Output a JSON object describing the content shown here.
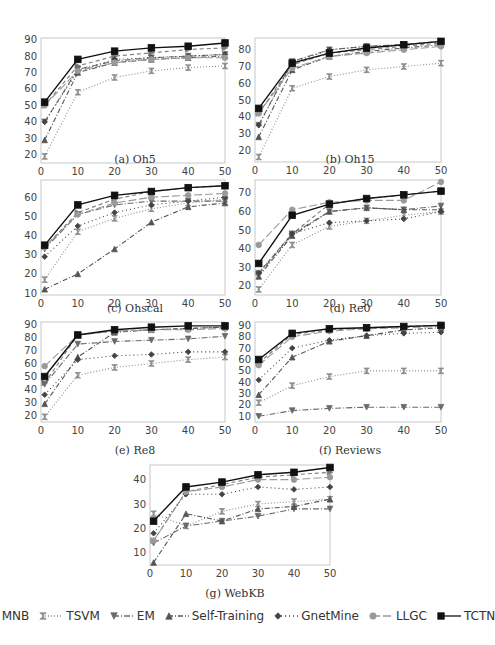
{
  "legend": [
    {
      "name": "MNB",
      "marker": "triangle-right",
      "dash": "4,3",
      "color": "#7a7a7a"
    },
    {
      "name": "TSVM",
      "marker": "hourglass",
      "dash": "1,2",
      "color": "#8c8c8c"
    },
    {
      "name": "EM",
      "marker": "triangle-down",
      "dash": "6,2,1,2",
      "color": "#6a6a6a"
    },
    {
      "name": "Self-Training",
      "marker": "triangle-up",
      "dash": "5,2,1,2",
      "color": "#555555"
    },
    {
      "name": "GnetMine",
      "marker": "diamond",
      "dash": "1,3",
      "color": "#444444"
    },
    {
      "name": "LLGC",
      "marker": "circle",
      "dash": "8,3",
      "color": "#9a9a9a"
    },
    {
      "name": "TCTN",
      "marker": "square",
      "dash": "",
      "color": "#111111"
    }
  ],
  "chart_data": [
    {
      "id": "a",
      "type": "line",
      "title": "(a) Oh5",
      "x": [
        1,
        10,
        20,
        30,
        40,
        50
      ],
      "xticks": [
        0,
        10,
        20,
        30,
        40,
        50
      ],
      "yticks": [
        20,
        30,
        40,
        50,
        60,
        70,
        80,
        90
      ],
      "ylim": [
        15,
        91
      ],
      "xlim": [
        0,
        50
      ],
      "xlabel": "",
      "ylabel": "",
      "series": [
        {
          "name": "MNB",
          "values": [
            50,
            74,
            80,
            82,
            84,
            85
          ]
        },
        {
          "name": "TSVM",
          "values": [
            19,
            58,
            67,
            71,
            73,
            74
          ]
        },
        {
          "name": "EM",
          "values": [
            40,
            72,
            77,
            79,
            80,
            81
          ]
        },
        {
          "name": "Self-Training",
          "values": [
            29,
            70,
            76,
            78,
            79,
            80
          ]
        },
        {
          "name": "GnetMine",
          "values": [
            40,
            71,
            78,
            79,
            80,
            81
          ]
        },
        {
          "name": "LLGC",
          "values": [
            50,
            71,
            76,
            78,
            79,
            79
          ]
        },
        {
          "name": "TCTN",
          "values": [
            52,
            78,
            83,
            85,
            86,
            88
          ]
        }
      ]
    },
    {
      "id": "b",
      "type": "line",
      "title": "(b) Oh15",
      "x": [
        1,
        10,
        20,
        30,
        40,
        50
      ],
      "xticks": [
        0,
        10,
        20,
        30,
        40,
        50
      ],
      "yticks": [
        20,
        30,
        40,
        50,
        60,
        70,
        80
      ],
      "ylim": [
        13,
        87
      ],
      "xlim": [
        0,
        50
      ],
      "xlabel": "",
      "ylabel": "",
      "series": [
        {
          "name": "MNB",
          "values": [
            42,
            71,
            78,
            80,
            82,
            84
          ]
        },
        {
          "name": "TSVM",
          "values": [
            16,
            57,
            64,
            68,
            70,
            72
          ]
        },
        {
          "name": "EM",
          "values": [
            35,
            73,
            80,
            82,
            83,
            85
          ]
        },
        {
          "name": "Self-Training",
          "values": [
            28,
            68,
            76,
            79,
            81,
            83
          ]
        },
        {
          "name": "GnetMine",
          "values": [
            35,
            72,
            80,
            82,
            83,
            85
          ]
        },
        {
          "name": "LLGC",
          "values": [
            42,
            69,
            76,
            78,
            80,
            82
          ]
        },
        {
          "name": "TCTN",
          "values": [
            45,
            72,
            78,
            81,
            83,
            85
          ]
        }
      ]
    },
    {
      "id": "c",
      "type": "line",
      "title": "(c) Ohscal",
      "x": [
        1,
        10,
        20,
        30,
        40,
        50
      ],
      "xticks": [
        0,
        10,
        20,
        30,
        40,
        50
      ],
      "yticks": [
        10,
        20,
        30,
        40,
        50,
        60
      ],
      "ylim": [
        9,
        69
      ],
      "xlim": [
        0,
        50
      ],
      "xlabel": "",
      "ylabel": "",
      "series": [
        {
          "name": "MNB",
          "values": [
            34,
            52,
            59,
            63,
            65,
            66
          ]
        },
        {
          "name": "TSVM",
          "values": [
            17,
            42,
            49,
            54,
            57,
            59
          ]
        },
        {
          "name": "EM",
          "values": [
            33,
            51,
            56,
            58,
            58,
            58
          ]
        },
        {
          "name": "Self-Training",
          "values": [
            12,
            20,
            33,
            47,
            55,
            57
          ]
        },
        {
          "name": "GnetMine",
          "values": [
            29,
            45,
            52,
            56,
            58,
            60
          ]
        },
        {
          "name": "LLGC",
          "values": [
            34,
            51,
            57,
            60,
            61,
            62
          ]
        },
        {
          "name": "TCTN",
          "values": [
            35,
            56,
            61,
            63,
            65,
            66
          ]
        }
      ]
    },
    {
      "id": "d",
      "type": "line",
      "title": "(d) Re0",
      "x": [
        1,
        10,
        20,
        30,
        40,
        50
      ],
      "xticks": [
        0,
        10,
        20,
        30,
        40,
        50
      ],
      "yticks": [
        20,
        30,
        40,
        50,
        60,
        70
      ],
      "ylim": [
        15,
        77
      ],
      "xlim": [
        0,
        50
      ],
      "xlabel": "",
      "ylabel": "",
      "series": [
        {
          "name": "MNB",
          "values": [
            27,
            48,
            64,
            67,
            69,
            71
          ]
        },
        {
          "name": "TSVM",
          "values": [
            18,
            42,
            52,
            55,
            58,
            60
          ]
        },
        {
          "name": "EM",
          "values": [
            26,
            48,
            60,
            62,
            61,
            63
          ]
        },
        {
          "name": "Self-Training",
          "values": [
            25,
            47,
            60,
            62,
            61,
            61
          ]
        },
        {
          "name": "GnetMine",
          "values": [
            27,
            48,
            54,
            55,
            56,
            60
          ]
        },
        {
          "name": "LLGC",
          "values": [
            42,
            61,
            65,
            66,
            66,
            76
          ]
        },
        {
          "name": "TCTN",
          "values": [
            32,
            58,
            64,
            67,
            69,
            71
          ]
        }
      ]
    },
    {
      "id": "e",
      "type": "line",
      "title": "(e) Re8",
      "x": [
        1,
        10,
        20,
        30,
        40,
        50
      ],
      "xticks": [
        0,
        10,
        20,
        30,
        40,
        50
      ],
      "yticks": [
        20,
        30,
        40,
        50,
        60,
        70,
        80,
        90
      ],
      "ylim": [
        15,
        92
      ],
      "xlim": [
        0,
        50
      ],
      "xlabel": "",
      "ylabel": "",
      "series": [
        {
          "name": "MNB",
          "values": [
            45,
            82,
            85,
            86,
            87,
            88
          ]
        },
        {
          "name": "TSVM",
          "values": [
            19,
            51,
            57,
            60,
            63,
            65
          ]
        },
        {
          "name": "EM",
          "values": [
            44,
            75,
            77,
            78,
            79,
            81
          ]
        },
        {
          "name": "Self-Training",
          "values": [
            29,
            65,
            84,
            86,
            87,
            88
          ]
        },
        {
          "name": "GnetMine",
          "values": [
            36,
            63,
            66,
            67,
            69,
            69
          ]
        },
        {
          "name": "LLGC",
          "values": [
            58,
            82,
            85,
            86,
            86,
            87
          ]
        },
        {
          "name": "TCTN",
          "values": [
            50,
            82,
            86,
            88,
            89,
            89
          ]
        }
      ]
    },
    {
      "id": "f",
      "type": "line",
      "title": "(f) Reviews",
      "x": [
        1,
        10,
        20,
        30,
        40,
        50
      ],
      "xticks": [
        0,
        10,
        20,
        30,
        40,
        50
      ],
      "yticks": [
        10,
        20,
        30,
        40,
        50,
        60,
        70,
        80,
        90
      ],
      "ylim": [
        5,
        93
      ],
      "xlim": [
        0,
        50
      ],
      "xlabel": "",
      "ylabel": "",
      "series": [
        {
          "name": "MNB",
          "values": [
            57,
            82,
            86,
            88,
            89,
            90
          ]
        },
        {
          "name": "TSVM",
          "values": [
            22,
            37,
            45,
            50,
            50,
            50
          ]
        },
        {
          "name": "EM",
          "values": [
            10,
            15,
            17,
            18,
            18,
            18
          ]
        },
        {
          "name": "Self-Training",
          "values": [
            29,
            62,
            76,
            81,
            86,
            88
          ]
        },
        {
          "name": "GnetMine",
          "values": [
            42,
            70,
            77,
            81,
            83,
            84
          ]
        },
        {
          "name": "LLGC",
          "values": [
            55,
            80,
            85,
            87,
            88,
            89
          ]
        },
        {
          "name": "TCTN",
          "values": [
            60,
            83,
            87,
            88,
            89,
            90
          ]
        }
      ]
    },
    {
      "id": "g",
      "type": "line",
      "title": "(g) WebKB",
      "x": [
        1,
        10,
        20,
        30,
        40,
        50
      ],
      "xticks": [
        0,
        10,
        20,
        30,
        40,
        50
      ],
      "yticks": [
        10,
        20,
        30,
        40
      ],
      "ylim": [
        5,
        46
      ],
      "xlim": [
        0,
        50
      ],
      "xlabel": "",
      "ylabel": "",
      "series": [
        {
          "name": "MNB",
          "values": [
            15,
            35,
            38,
            41,
            42,
            43
          ]
        },
        {
          "name": "TSVM",
          "values": [
            26,
            21,
            27,
            30,
            31,
            32
          ]
        },
        {
          "name": "EM",
          "values": [
            14,
            21,
            23,
            25,
            28,
            28
          ]
        },
        {
          "name": "Self-Training",
          "values": [
            6,
            26,
            23,
            28,
            29,
            32
          ]
        },
        {
          "name": "GnetMine",
          "values": [
            18,
            34,
            34,
            37,
            36,
            37
          ]
        },
        {
          "name": "LLGC",
          "values": [
            15,
            35,
            37,
            40,
            40,
            41
          ]
        },
        {
          "name": "TCTN",
          "values": [
            23,
            37,
            39,
            42,
            43,
            45
          ]
        }
      ]
    }
  ]
}
